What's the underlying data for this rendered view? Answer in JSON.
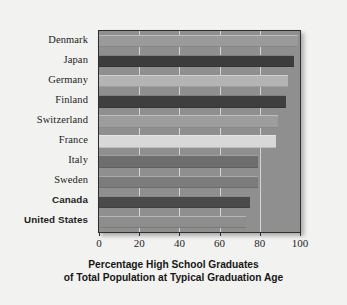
{
  "chart_data": {
    "type": "bar",
    "orientation": "horizontal",
    "title": "",
    "xlabel": "Percentage High School Graduates of Total Population at Typical Graduation Age",
    "xlabel_line1": "Percentage High School Graduates",
    "xlabel_line2": "of Total Population at Typical Graduation Age",
    "ylabel": "",
    "xlim": [
      0,
      100
    ],
    "ylim": [
      0,
      10
    ],
    "grid": true,
    "gridlines_x": [
      20,
      40,
      60,
      80
    ],
    "legend": false,
    "xticks": [
      0,
      20,
      40,
      60,
      80,
      100
    ],
    "xtick_labels": [
      "0",
      "20",
      "40",
      "60",
      "80",
      "100"
    ],
    "categories": [
      "Denmark",
      "Japan",
      "Germany",
      "Finland",
      "Switzerland",
      "France",
      "Italy",
      "Sweden",
      "Canada",
      "United States"
    ],
    "values": [
      99,
      97,
      94,
      93,
      89,
      88,
      79,
      79,
      75,
      73
    ],
    "bar_colors": [
      "#9a9a9a",
      "#3c3c3c",
      "#b4b4b4",
      "#3f3f3f",
      "#9d9d9d",
      "#d8d8d8",
      "#6e6e6e",
      "#7c7c7c",
      "#4a4a4a",
      "#8d8d8d"
    ],
    "bold_categories": [
      "Canada",
      "United States"
    ],
    "plot_background": "#8f8f8f",
    "figure_background": "#f2f2f0",
    "axis_color": "#2e2e2e",
    "gridline_color": "#ebebeb"
  }
}
